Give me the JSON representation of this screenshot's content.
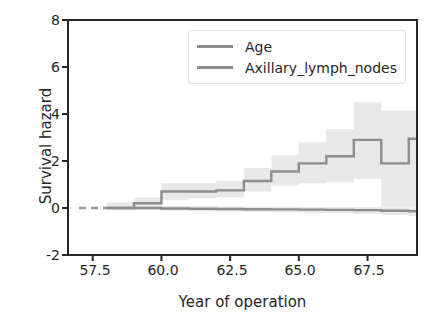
{
  "chart_data": {
    "type": "line",
    "title": "",
    "xlabel": "Year of operation",
    "ylabel": "Survival hazard",
    "xlim": [
      56.6,
      69.3
    ],
    "ylim": [
      -2,
      8
    ],
    "xticks": [
      57.5,
      60.0,
      62.5,
      65.0,
      67.5
    ],
    "xtick_labels": [
      "57.5",
      "60.0",
      "62.5",
      "65.0",
      "67.5"
    ],
    "yticks": [
      -2,
      0,
      2,
      4,
      6,
      8
    ],
    "ytick_labels": [
      "-2",
      "0",
      "2",
      "4",
      "6",
      "8"
    ],
    "grid": false,
    "legend_position": "upper center",
    "style": "step-post with shaded confidence band",
    "series": [
      {
        "name": "Age",
        "color": "#8d8d8d",
        "x": [
          58.0,
          59.0,
          60.0,
          61.0,
          62.0,
          63.0,
          64.0,
          65.0,
          66.0,
          67.0,
          68.0,
          69.0
        ],
        "values": [
          0.0,
          0.0,
          -0.02,
          -0.03,
          -0.04,
          -0.05,
          -0.06,
          -0.07,
          -0.08,
          -0.09,
          -0.12,
          -0.14
        ],
        "band_lower": [
          -0.1,
          -0.1,
          -0.12,
          -0.14,
          -0.16,
          -0.17,
          -0.18,
          -0.2,
          -0.22,
          -0.24,
          -0.3,
          -0.34
        ],
        "band_upper": [
          0.1,
          0.1,
          0.08,
          0.07,
          0.06,
          0.05,
          0.05,
          0.04,
          0.04,
          0.03,
          0.02,
          0.02
        ]
      },
      {
        "name": "Axillary_lymph_nodes",
        "color": "#8d8d8d",
        "x": [
          58.0,
          59.0,
          60.0,
          61.0,
          62.0,
          63.0,
          64.0,
          65.0,
          66.0,
          67.0,
          68.0,
          69.0
        ],
        "values": [
          0.0,
          0.2,
          0.7,
          0.7,
          0.75,
          1.15,
          1.55,
          1.9,
          2.2,
          2.9,
          1.9,
          2.95
        ],
        "band_lower": [
          -0.05,
          0.05,
          0.35,
          0.4,
          0.45,
          0.7,
          0.95,
          1.05,
          1.1,
          1.25,
          0.05,
          0.05
        ],
        "band_upper": [
          0.25,
          0.45,
          1.05,
          1.05,
          1.15,
          1.7,
          2.25,
          2.8,
          3.35,
          4.5,
          4.15,
          4.15
        ]
      }
    ],
    "leading_dashed_segment": {
      "x_start": 57.0,
      "x_end": 58.0,
      "y": 0.0,
      "color": "#9a9a9a"
    }
  },
  "legend": {
    "entries": [
      {
        "label": "Age",
        "swatch_color": "#8d8d8d"
      },
      {
        "label": "Axillary_lymph_nodes",
        "swatch_color": "#8d8d8d"
      }
    ]
  },
  "colors": {
    "axis": "#262626",
    "line": "#8d8d8d",
    "band": "#e8e8e8",
    "background": "#ffffff",
    "text": "#262626"
  }
}
